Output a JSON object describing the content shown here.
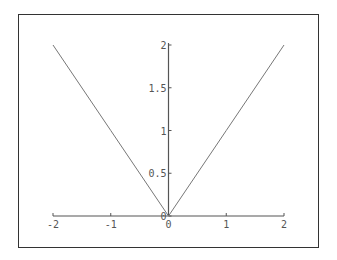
{
  "chart_data": {
    "type": "line",
    "title": "",
    "xlabel": "",
    "ylabel": "",
    "xlim": [
      -2,
      2
    ],
    "ylim": [
      0,
      2
    ],
    "grid": false,
    "legend": null,
    "x_ticks": [
      "-2",
      "-1",
      "0",
      "1",
      "2"
    ],
    "y_ticks": [
      "0",
      "0.5",
      "1",
      "1.5",
      "2"
    ],
    "series": [
      {
        "name": "|x|",
        "x": [
          -2,
          -1,
          0,
          1,
          2
        ],
        "y": [
          2,
          1,
          0,
          1,
          2
        ],
        "color": "#777777"
      }
    ]
  },
  "colors": {
    "axis": "#555555",
    "line": "#777777",
    "frame": "#333333"
  }
}
